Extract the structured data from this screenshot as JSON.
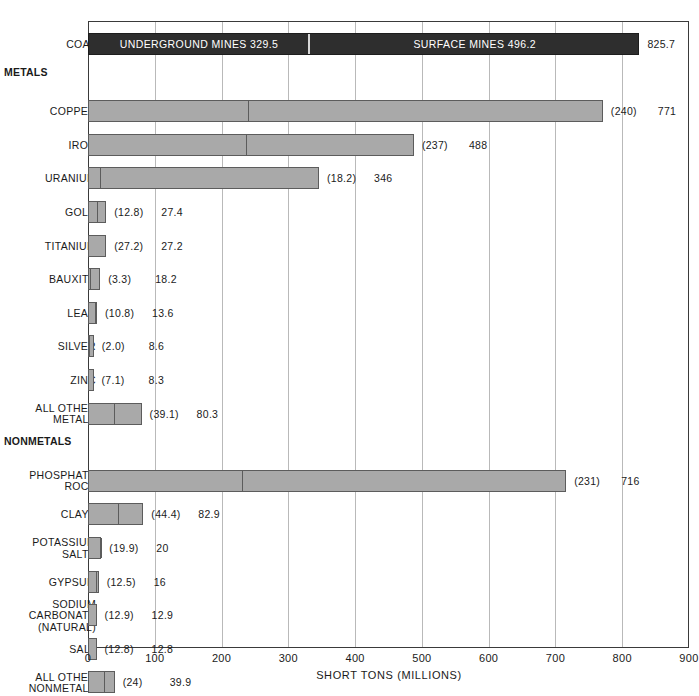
{
  "chart_data": {
    "type": "bar",
    "orientation": "horizontal",
    "title": "",
    "xlabel": "SHORT TONS (MILLIONS)",
    "ylabel": "",
    "xlim": [
      0,
      900
    ],
    "xticks": [
      0,
      100,
      200,
      300,
      400,
      500,
      600,
      700,
      800,
      900
    ],
    "grid": true,
    "legend": "none",
    "stacked": true,
    "segment_names": [
      "UNDERGROUND MINES",
      "SURFACE MINES"
    ],
    "colors": {
      "coal_bar": "#2e2e2e",
      "standard_bar": "#a9a9a9",
      "bar_outline": "#5c5c5c",
      "gridline": "#b9b9b9",
      "frame": "#3a3a3a",
      "text": "#1a1a1a"
    },
    "rows": [
      {
        "kind": "bar",
        "label": "COAL",
        "underground": 329.5,
        "total": 825.7,
        "style": "dark",
        "seg1_text": "UNDERGROUND MINES 329.5",
        "seg2_text": "SURFACE MINES 496.2",
        "paren": "",
        "total_text": "825.7"
      },
      {
        "kind": "section",
        "label": "METALS"
      },
      {
        "kind": "bar",
        "label": "COPPER",
        "underground": 240,
        "total": 771,
        "style": "light",
        "paren": "(240)",
        "total_text": "771"
      },
      {
        "kind": "bar",
        "label": "IRON",
        "underground": 237,
        "total": 488,
        "style": "light",
        "paren": "(237)",
        "total_text": "488"
      },
      {
        "kind": "bar",
        "label": "URANIUM",
        "underground": 18.2,
        "total": 346,
        "style": "light",
        "paren": "(18.2)",
        "total_text": "346"
      },
      {
        "kind": "bar",
        "label": "GOLD",
        "underground": 12.8,
        "total": 27.4,
        "style": "light",
        "paren": "(12.8)",
        "total_text": "27.4"
      },
      {
        "kind": "bar",
        "label": "TITANIUM",
        "underground": 27.2,
        "total": 27.2,
        "style": "light",
        "paren": "(27.2)",
        "total_text": "27.2"
      },
      {
        "kind": "bar",
        "label": "BAUXITE",
        "underground": 3.3,
        "total": 18.2,
        "style": "light",
        "paren": "(3.3)",
        "total_text": "18.2"
      },
      {
        "kind": "bar",
        "label": "LEAD",
        "underground": 10.8,
        "total": 13.6,
        "style": "light",
        "paren": "(10.8)",
        "total_text": "13.6"
      },
      {
        "kind": "bar",
        "label": "SILVER",
        "underground": 2.0,
        "total": 8.6,
        "style": "light",
        "paren": "(2.0)",
        "total_text": "8.6"
      },
      {
        "kind": "bar",
        "label": "ZINC",
        "underground": 7.1,
        "total": 8.3,
        "style": "light",
        "paren": "(7.1)",
        "total_text": "8.3"
      },
      {
        "kind": "bar",
        "label": "ALL OTHER\nMETALS",
        "underground": 39.1,
        "total": 80.3,
        "style": "light",
        "paren": "(39.1)",
        "total_text": "80.3"
      },
      {
        "kind": "section",
        "label": "NONMETALS"
      },
      {
        "kind": "bar",
        "label": "PHOSPHATE\nROCK",
        "underground": 231,
        "total": 716,
        "style": "light",
        "paren": "(231)",
        "total_text": "716"
      },
      {
        "kind": "bar",
        "label": "CLAYS",
        "underground": 44.4,
        "total": 82.9,
        "style": "light",
        "paren": "(44.4)",
        "total_text": "82.9"
      },
      {
        "kind": "bar",
        "label": "POTASSIUM\nSALTS",
        "underground": 19.9,
        "total": 20,
        "style": "light",
        "paren": "(19.9)",
        "total_text": "20"
      },
      {
        "kind": "bar",
        "label": "GYPSUM",
        "underground": 12.5,
        "total": 16,
        "style": "light",
        "paren": "(12.5)",
        "total_text": "16"
      },
      {
        "kind": "bar",
        "label": "SODIUM\nCARBONATE\n(NATURAL)",
        "underground": 12.9,
        "total": 12.9,
        "style": "light",
        "paren": "(12.9)",
        "total_text": "12.9"
      },
      {
        "kind": "bar",
        "label": "SALT",
        "underground": 12.8,
        "total": 12.8,
        "style": "light",
        "paren": "(12.8)",
        "total_text": "12.8"
      },
      {
        "kind": "bar",
        "label": "ALL OTHER\nNONMETALS",
        "underground": 24,
        "total": 39.9,
        "style": "light",
        "paren": "(24)",
        "total_text": "39.9"
      }
    ]
  }
}
